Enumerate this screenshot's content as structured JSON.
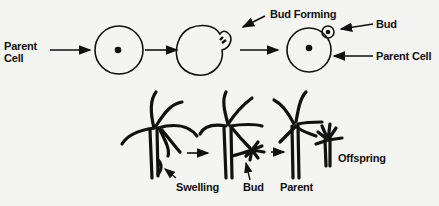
{
  "diagram": {
    "yeast_row": {
      "labels": {
        "parent_cell_left": [
          "Parent",
          "Cell"
        ],
        "bud_forming": "Bud Forming",
        "bud": "Bud",
        "parent_cell_right": "Parent Cell"
      },
      "stages": [
        "Parent cell",
        "Bud forming",
        "Bud attached to parent cell"
      ]
    },
    "hydra_row": {
      "labels": {
        "swelling": "Swelling",
        "bud": "Bud",
        "parent": "Parent",
        "offspring": "Offspring"
      },
      "stages": [
        "Hydra with swelling",
        "Hydra with bud",
        "Parent and detached offspring"
      ]
    },
    "colors": {
      "ink": "#111111",
      "paper": "#f4f4f2"
    }
  }
}
